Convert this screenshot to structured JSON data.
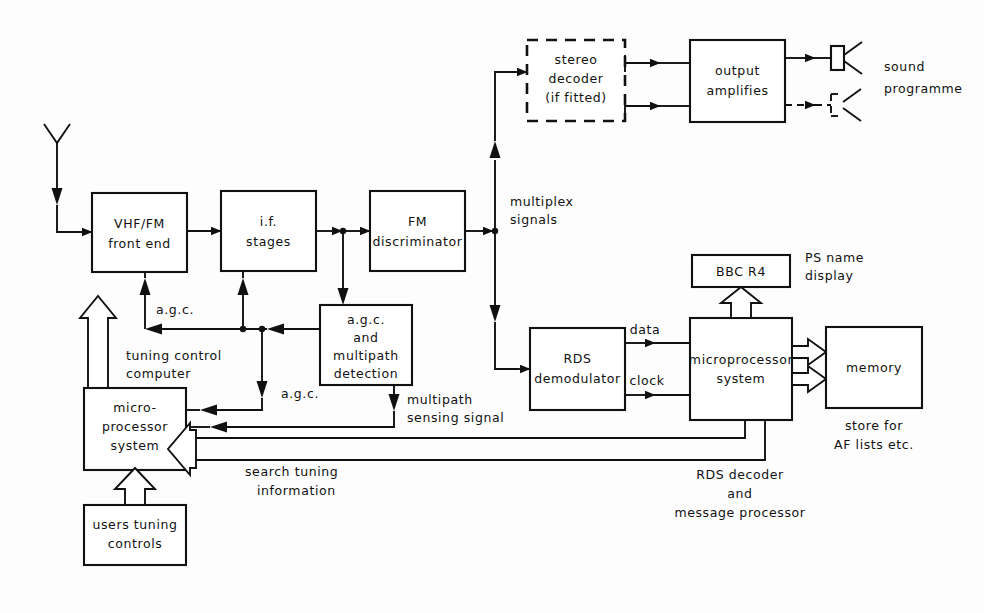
{
  "diagram": {
    "blocks": {
      "vhf_fm": {
        "line1": "VHF/FM",
        "line2": "front  end"
      },
      "if_stages": {
        "line1": "i.f.",
        "line2": "stages"
      },
      "fm_disc": {
        "line1": "FM",
        "line2": "discriminator"
      },
      "agc_multipath": {
        "line1": "a.g.c.",
        "line2": "and",
        "line3": "multipath",
        "line4": "detection"
      },
      "stereo_decoder": {
        "line1": "stereo",
        "line2": "decoder",
        "line3": "(if fitted)"
      },
      "output_amps": {
        "line1": "output",
        "line2": "amplifies"
      },
      "rds_demod": {
        "line1": "RDS",
        "line2": "demodulator"
      },
      "micro_right": {
        "line1": "microprocessor",
        "line2": "system"
      },
      "micro_left": {
        "line1": "micro-",
        "line2": "processor",
        "line3": "system"
      },
      "users_tuning": {
        "line1": "users  tuning",
        "line2": "controls"
      },
      "bbc_r4": {
        "line1": "BBC  R4"
      },
      "memory": {
        "line1": "memory"
      }
    },
    "labels": {
      "multiplex": {
        "line1": "multiplex",
        "line2": "signals"
      },
      "sound": {
        "line1": "sound",
        "line2": "programme"
      },
      "agc_top": "a.g.c.",
      "agc_bottom": "a.g.c.",
      "tuning_control": {
        "line1": "tuning  control",
        "line2": "computer"
      },
      "multipath_sensing": {
        "line1": "multipath",
        "line2": "sensing  signal"
      },
      "data": "data",
      "clock": "clock",
      "ps_name": {
        "line1": "PS  name",
        "line2": "display"
      },
      "store_for": {
        "line1": "store  for",
        "line2": "AF  lists  etc."
      },
      "search_tuning": {
        "line1": "search  tuning",
        "line2": "information"
      },
      "rds_decoder": {
        "line1": "RDS  decoder",
        "line2": "and",
        "line3": "message  processor"
      }
    },
    "icons": {
      "antenna": "antenna-icon",
      "speaker_solid": "speaker-icon",
      "speaker_dashed": "speaker-optional-icon"
    },
    "colors": {
      "ink": "#111111",
      "paper": "#ffffff"
    }
  }
}
